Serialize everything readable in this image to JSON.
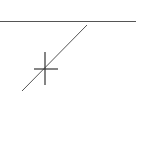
{
  "canvas": {
    "background": "#ffffff",
    "shapes": [
      {
        "type": "line",
        "name": "horizontal-line",
        "x1": 0,
        "y1": 21.5,
        "x2": 136,
        "y2": 21.5,
        "color": "#555555",
        "width": 1.2
      },
      {
        "type": "line",
        "name": "diagonal-line",
        "x1": 87,
        "y1": 25,
        "x2": 22,
        "y2": 91,
        "color": "#555555",
        "width": 1
      }
    ],
    "cursor": {
      "type": "crosshair",
      "cx": 45,
      "cy": 69,
      "vy1": 52,
      "vy2": 85,
      "hx1": 34,
      "hx2": 58,
      "color": "#333333"
    }
  }
}
